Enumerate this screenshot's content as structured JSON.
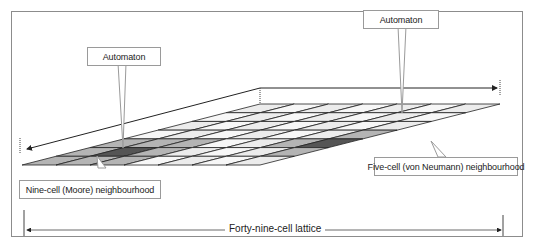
{
  "diagram": {
    "type": "cellular-automaton-lattice",
    "grid": {
      "rows": 7,
      "cols": 7,
      "total_cells": 49
    },
    "colors": {
      "frame": "#8c8c8c",
      "cell_light": "#ececec",
      "cell_white": "#f7f7f7",
      "cell_neighbour": "#b4b4b4",
      "cell_neighbour_mid": "#9a9a9a",
      "cell_automaton": "#555555",
      "grid_line": "#222222",
      "callout_border": "#9a9a9a"
    },
    "callouts": {
      "automaton_left": "Automaton",
      "automaton_right": "Automaton",
      "moore": "Nine-cell (Moore) neighbourhood",
      "von_neumann": "Five-cell (von Neumann) neighbourhood"
    },
    "lattice_label": "Forty-nine-cell lattice"
  }
}
